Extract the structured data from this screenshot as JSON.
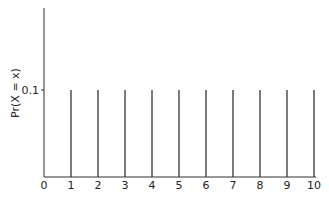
{
  "chart_data": {
    "type": "bar",
    "subtype": "stem",
    "title": "",
    "xlabel": "",
    "ylabel": "Pr(X = x)",
    "x": [
      1,
      2,
      3,
      4,
      5,
      6,
      7,
      8,
      9,
      10
    ],
    "values": [
      0.1,
      0.1,
      0.1,
      0.1,
      0.1,
      0.1,
      0.1,
      0.1,
      0.1,
      0.1
    ],
    "xticks": [
      "0",
      "1",
      "2",
      "3",
      "4",
      "5",
      "6",
      "7",
      "8",
      "9",
      "10"
    ],
    "yticks": [
      "0.1"
    ],
    "xlim": [
      0,
      10
    ],
    "ylim": [
      0,
      0.2
    ],
    "grid": false,
    "legend": null
  }
}
